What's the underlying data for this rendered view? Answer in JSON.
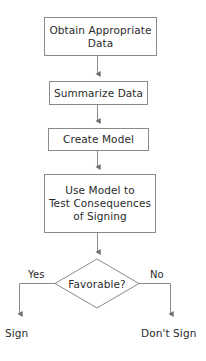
{
  "diagram": {
    "background_color": "#ffffff",
    "line_color": "#8a8a8a",
    "text_color": "#2b2b2b",
    "width": 206,
    "height": 361,
    "nodes": [
      {
        "id": "obtain-data",
        "shape": "rectangle",
        "label": "Obtain Appropriate\nData",
        "x": 44,
        "y": 17,
        "width": 113,
        "height": 39
      },
      {
        "id": "summarize-data",
        "shape": "rectangle",
        "label": "Summarize Data",
        "x": 49,
        "y": 81,
        "width": 99,
        "height": 24
      },
      {
        "id": "create-model",
        "shape": "rectangle",
        "label": "Create Model",
        "x": 48,
        "y": 128,
        "width": 101,
        "height": 23
      },
      {
        "id": "test-consequences",
        "shape": "rectangle",
        "label": "Use Model to\nTest Consequences\nof Signing",
        "x": 44,
        "y": 174,
        "width": 112,
        "height": 59
      },
      {
        "id": "favorable-decision",
        "shape": "diamond",
        "label": "Favorable?",
        "x": 55,
        "y": 259,
        "width": 84,
        "height": 49
      }
    ],
    "terminals": [
      {
        "id": "sign",
        "label": "Sign",
        "x": 5,
        "y": 327
      },
      {
        "id": "dont-sign",
        "label": "Don't Sign",
        "x": 141,
        "y": 327
      }
    ],
    "edge_labels": [
      {
        "id": "yes-branch",
        "label": "Yes",
        "x": 27,
        "y": 269
      },
      {
        "id": "no-branch",
        "label": "No",
        "x": 149,
        "y": 269
      }
    ],
    "connectors": [
      {
        "id": "obtain-to-summarize",
        "from": "obtain-data",
        "to": "summarize-data",
        "path": "M 97.5 56 L 97.5 75",
        "arrow": true
      },
      {
        "id": "summarize-to-create",
        "from": "summarize-data",
        "to": "create-model",
        "path": "M 97.5 105 L 97.5 122",
        "arrow": true
      },
      {
        "id": "create-to-test",
        "from": "create-model",
        "to": "test-consequences",
        "path": "M 97.5 151 L 97.5 168",
        "arrow": true
      },
      {
        "id": "test-to-favorable",
        "from": "test-consequences",
        "to": "favorable-decision",
        "path": "M 97.5 233 L 97.5 253",
        "arrow": true
      },
      {
        "id": "favorable-to-sign",
        "from": "favorable-decision",
        "to": "sign",
        "path": "M 55 283.5 L 19.5 283.5 L 19.5 315",
        "arrow": true
      },
      {
        "id": "favorable-to-dont-sign",
        "from": "favorable-decision",
        "to": "dont-sign",
        "path": "M 139 283.5 L 170.5 283.5 L 170.5 315",
        "arrow": true
      }
    ]
  }
}
